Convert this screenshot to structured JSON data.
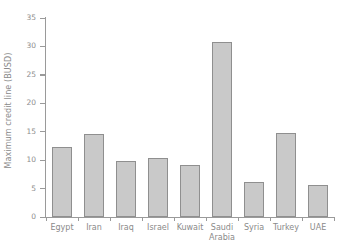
{
  "chart_data": {
    "type": "bar",
    "title": "",
    "xlabel": "",
    "ylabel": "Maximum credit line (BUSD)",
    "categories": [
      "Egypt",
      "Iran",
      "Iraq",
      "Israel",
      "Kuwait",
      "Saudi Arabia",
      "Syria",
      "Turkey",
      "UAE"
    ],
    "values": [
      12.3,
      14.6,
      9.8,
      10.4,
      9.1,
      30.8,
      6.1,
      14.7,
      5.7
    ],
    "ylim": [
      0,
      35
    ],
    "ytick_labels": [
      "0",
      "5",
      "10",
      "15",
      "20",
      "25",
      "30",
      "35"
    ],
    "ytick_values": [
      0,
      5,
      10,
      15,
      20,
      25,
      30,
      35
    ],
    "grid": false,
    "legend": false,
    "bar_fill_color": "#c9c9c9",
    "bar_border_color": "#8f8f8f",
    "axis_color": "#9a9a9a",
    "text_color": "#8a8a8a",
    "background_color": "#ffffff"
  },
  "axis": {
    "y_label": "Maximum credit line (BUSD)"
  },
  "categories_display": [
    {
      "line1": "Egypt",
      "line2": ""
    },
    {
      "line1": "Iran",
      "line2": ""
    },
    {
      "line1": "Iraq",
      "line2": ""
    },
    {
      "line1": "Israel",
      "line2": ""
    },
    {
      "line1": "Kuwait",
      "line2": ""
    },
    {
      "line1": "Saudi",
      "line2": "Arabia"
    },
    {
      "line1": "Syria",
      "line2": ""
    },
    {
      "line1": "Turkey",
      "line2": ""
    },
    {
      "line1": "UAE",
      "line2": ""
    }
  ]
}
